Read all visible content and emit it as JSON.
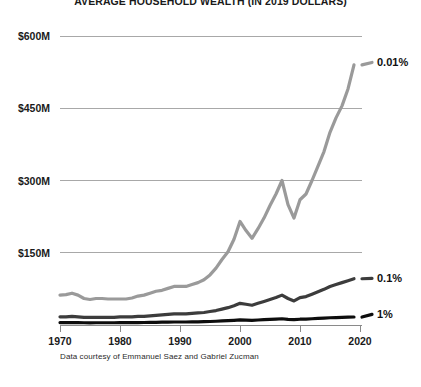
{
  "chart_data": {
    "type": "line",
    "title": "AVERAGE HOUSEHOLD WEALTH (IN 2019 DOLLARS)",
    "xlabel": "",
    "ylabel": "",
    "credit": "Data courtesy of Emmanuel Saez and Gabriel Zucman",
    "grid": true,
    "legend_position": "right-inline",
    "xlim": [
      1970,
      2020
    ],
    "ylim": [
      0,
      600
    ],
    "y_unit": "millions of 2019 dollars",
    "y_ticks": [
      150,
      300,
      450,
      600
    ],
    "y_tick_labels": [
      "$150M",
      "$300M",
      "$450M",
      "$600M"
    ],
    "x_ticks": [
      1970,
      1980,
      1990,
      2000,
      2010,
      2020
    ],
    "x_tick_labels": [
      "1970",
      "1980",
      "1990",
      "2000",
      "2010",
      "2020"
    ],
    "colors": {
      "top_0_01": "#9a9a9a",
      "top_0_1": "#3c3c3c",
      "top_1": "#0d0d0d",
      "gridline": "#a8a8a8",
      "axis": "#8a8a8a",
      "text": "#1a1a1a",
      "background": "#ffffff"
    },
    "x": [
      1970,
      1971,
      1972,
      1973,
      1974,
      1975,
      1976,
      1977,
      1978,
      1979,
      1980,
      1981,
      1982,
      1983,
      1984,
      1985,
      1986,
      1987,
      1988,
      1989,
      1990,
      1991,
      1992,
      1993,
      1994,
      1995,
      1996,
      1997,
      1998,
      1999,
      2000,
      2001,
      2002,
      2003,
      2004,
      2005,
      2006,
      2007,
      2008,
      2009,
      2010,
      2011,
      2012,
      2013,
      2014,
      2015,
      2016,
      2017,
      2018,
      2019
    ],
    "series": [
      {
        "name": "0.01%",
        "label": "0.01%",
        "color": "#9a9a9a",
        "width": 3.2,
        "label_x": 2021,
        "label_y": 545,
        "values": [
          62,
          63,
          66,
          62,
          55,
          53,
          55,
          55,
          54,
          54,
          54,
          54,
          56,
          60,
          62,
          66,
          70,
          72,
          76,
          80,
          80,
          80,
          84,
          88,
          94,
          104,
          118,
          136,
          152,
          178,
          215,
          196,
          180,
          200,
          222,
          248,
          272,
          300,
          250,
          222,
          260,
          272,
          300,
          330,
          360,
          400,
          430,
          455,
          490,
          540
        ]
      },
      {
        "name": "0.1%",
        "label": "0.1%",
        "color": "#3c3c3c",
        "width": 3.2,
        "label_x": 2021,
        "label_y": 97,
        "values": [
          17,
          17,
          18,
          17,
          16,
          16,
          16,
          16,
          16,
          16,
          17,
          17,
          17,
          18,
          18,
          19,
          20,
          21,
          22,
          23,
          23,
          23,
          24,
          25,
          26,
          28,
          30,
          33,
          36,
          40,
          45,
          43,
          41,
          45,
          49,
          53,
          57,
          62,
          55,
          50,
          57,
          59,
          64,
          69,
          74,
          80,
          84,
          88,
          92,
          96
        ]
      },
      {
        "name": "1%",
        "label": "1%",
        "color": "#0d0d0d",
        "width": 3.2,
        "label_x": 2021,
        "label_y": 22,
        "values": [
          5.0,
          5.0,
          5.2,
          5.0,
          4.7,
          4.6,
          4.7,
          4.7,
          4.7,
          4.7,
          4.8,
          4.8,
          4.9,
          5.1,
          5.2,
          5.4,
          5.6,
          5.8,
          6.0,
          6.2,
          6.2,
          6.2,
          6.4,
          6.6,
          6.9,
          7.3,
          7.8,
          8.4,
          9.0,
          9.8,
          10.6,
          10.2,
          9.8,
          10.4,
          11.0,
          11.7,
          12.3,
          13.0,
          11.8,
          11.0,
          12.0,
          12.3,
          13.0,
          13.7,
          14.3,
          15.0,
          15.4,
          15.8,
          16.2,
          16.6
        ]
      }
    ]
  }
}
